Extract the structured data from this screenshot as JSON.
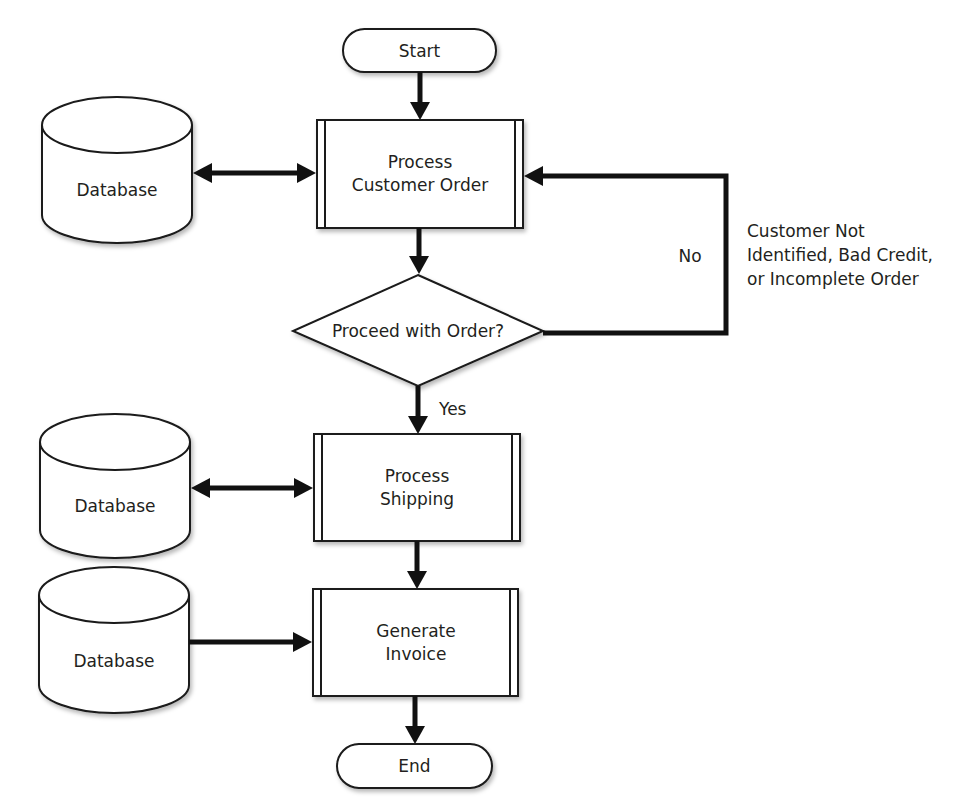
{
  "diagram": {
    "type": "flowchart",
    "background": "#ffffff",
    "line_color": "#111111",
    "text_color": "#231f20",
    "terminals": {
      "start": {
        "label": "Start"
      },
      "end": {
        "label": "End"
      }
    },
    "processes": [
      {
        "id": "process-customer-order",
        "lines": [
          "Process",
          "Customer Order"
        ]
      },
      {
        "id": "process-shipping",
        "lines": [
          "Process",
          "Shipping"
        ]
      },
      {
        "id": "generate-invoice",
        "lines": [
          "Generate",
          "Invoice"
        ]
      }
    ],
    "decision": {
      "label": "Proceed with Order?"
    },
    "databases": [
      {
        "label": "Database",
        "connects_to": "process-customer-order",
        "direction": "bidirectional"
      },
      {
        "label": "Database",
        "connects_to": "process-shipping",
        "direction": "bidirectional"
      },
      {
        "label": "Database",
        "connects_to": "generate-invoice",
        "direction": "to-process"
      }
    ],
    "edges": {
      "yes_label": "Yes",
      "no_label": "No",
      "no_reason_lines": [
        "Customer Not",
        "Identified, Bad Credit,",
        "or Incomplete Order"
      ]
    }
  }
}
